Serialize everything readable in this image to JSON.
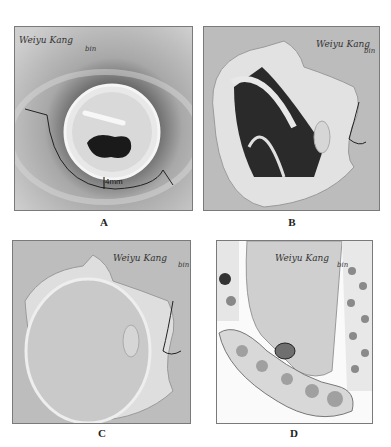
{
  "figure": {
    "panels": [
      {
        "id": "A",
        "label": "A",
        "signature": "Weiyu Kang",
        "signature_suffix": "bin",
        "annotation": "4mm"
      },
      {
        "id": "B",
        "label": "B",
        "signature": "Weiyu Kang",
        "signature_suffix": "bin"
      },
      {
        "id": "C",
        "label": "C",
        "signature": "Weiyu Kang",
        "signature_suffix": "bin"
      },
      {
        "id": "D",
        "label": "D",
        "signature": "Weiyu Kang",
        "signature_suffix": "bin"
      }
    ]
  }
}
